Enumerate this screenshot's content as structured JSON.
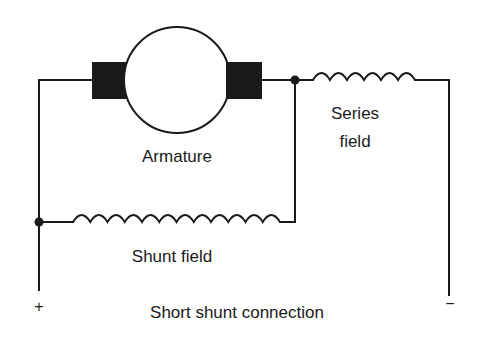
{
  "diagram": {
    "title": "Short shunt connection",
    "labels": {
      "armature": "Armature",
      "series_field_line1": "Series",
      "series_field_line2": "field",
      "shunt_field": "Shunt field",
      "positive_terminal": "+",
      "negative_terminal": "−"
    },
    "components": [
      {
        "name": "armature",
        "type": "dc-machine-armature-with-brushes"
      },
      {
        "name": "series-field",
        "type": "inductor-coil",
        "turns": 6
      },
      {
        "name": "shunt-field",
        "type": "inductor-coil",
        "turns": 12
      }
    ],
    "colors": {
      "ink": "#1a1a1a",
      "background": "#ffffff"
    }
  }
}
